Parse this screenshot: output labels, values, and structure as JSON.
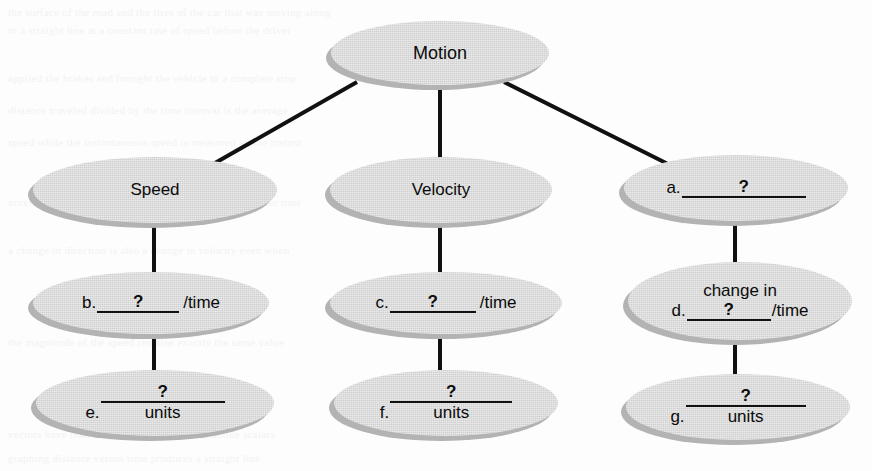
{
  "diagram": {
    "type": "concept-map",
    "title_node": "Motion",
    "colors": {
      "node_fill": "#cfcfcf",
      "node_shadow": "#b3b3b3",
      "connector": "#111111",
      "text": "#0b0b0b",
      "page_background": "#fdfdfd"
    },
    "nodes": [
      {
        "id": "motion",
        "level": 0,
        "column": "center",
        "text": "Motion",
        "has_blank": false
      },
      {
        "id": "speed",
        "level": 1,
        "column": "left",
        "text": "Speed",
        "has_blank": false
      },
      {
        "id": "velocity",
        "level": 1,
        "column": "center",
        "text": "Velocity",
        "has_blank": false
      },
      {
        "id": "blank-a",
        "level": 1,
        "column": "right",
        "has_blank": true,
        "prefix": "a.",
        "blank_mark": "?",
        "suffix": "",
        "top_line": "",
        "under_word": ""
      },
      {
        "id": "blank-b",
        "level": 2,
        "column": "left",
        "has_blank": true,
        "prefix": "b.",
        "blank_mark": "?",
        "suffix": "/time",
        "top_line": "",
        "under_word": ""
      },
      {
        "id": "blank-c",
        "level": 2,
        "column": "center",
        "has_blank": true,
        "prefix": "c.",
        "blank_mark": "?",
        "suffix": "/time",
        "top_line": "",
        "under_word": ""
      },
      {
        "id": "blank-d",
        "level": 2,
        "column": "right",
        "has_blank": true,
        "prefix": "d.",
        "blank_mark": "?",
        "suffix": "/time",
        "top_line": "change in",
        "under_word": ""
      },
      {
        "id": "blank-e",
        "level": 3,
        "column": "left",
        "has_blank": true,
        "prefix": "e.",
        "blank_mark": "?",
        "suffix": "",
        "top_line": "",
        "under_word": "units"
      },
      {
        "id": "blank-f",
        "level": 3,
        "column": "center",
        "has_blank": true,
        "prefix": "f.",
        "blank_mark": "?",
        "suffix": "",
        "top_line": "",
        "under_word": "units"
      },
      {
        "id": "blank-g",
        "level": 3,
        "column": "right",
        "has_blank": true,
        "prefix": "g.",
        "blank_mark": "?",
        "suffix": "",
        "top_line": "",
        "under_word": "units"
      }
    ],
    "edges": [
      {
        "from": "motion",
        "to": "speed",
        "style": "diagonal"
      },
      {
        "from": "motion",
        "to": "velocity",
        "style": "vertical"
      },
      {
        "from": "motion",
        "to": "blank-a",
        "style": "diagonal"
      },
      {
        "from": "speed",
        "to": "blank-b",
        "style": "vertical"
      },
      {
        "from": "velocity",
        "to": "blank-c",
        "style": "vertical"
      },
      {
        "from": "blank-a",
        "to": "blank-d",
        "style": "vertical"
      },
      {
        "from": "blank-b",
        "to": "blank-e",
        "style": "vertical"
      },
      {
        "from": "blank-c",
        "to": "blank-f",
        "style": "vertical"
      },
      {
        "from": "blank-d",
        "to": "blank-g",
        "style": "vertical"
      }
    ]
  },
  "ghost_text": {
    "lines": [
      "the surface of the road and the tires of the car that was moving along",
      "in a straight line at a constant rate of speed before the driver",
      "applied the brakes and brought the vehicle to a complete stop",
      "distance traveled divided by the time interval is the average",
      "speed while the instantaneous speed is measured at one instant",
      "acceleration describes how quickly velocity changes over time",
      "a change in direction is also a change in velocity even when",
      "the magnitude of the speed remains exactly the same value",
      "vectors have both magnitude and direction unlike scalars",
      "graphing distance versus time produces a straight line"
    ]
  }
}
